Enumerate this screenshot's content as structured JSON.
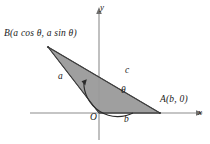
{
  "figure": {
    "type": "geometry-diagram",
    "background_color": "#ffffff",
    "axes": {
      "x_label": "x",
      "y_label": "y",
      "axis_color": "#8c8c8c",
      "origin_label": "O"
    },
    "triangle": {
      "fill_color": "#9a9a9a",
      "edge_color": "#4d4d4d",
      "vertices": [
        {
          "name": "O",
          "label": "O",
          "x": 99,
          "y": 113
        },
        {
          "name": "A",
          "label": "A(b, 0)",
          "x": 160,
          "y": 113
        },
        {
          "name": "B",
          "label": "B(a cos θ, a sin θ)",
          "x": 48,
          "y": 47
        }
      ],
      "sides": [
        {
          "name": "side-a",
          "label": "a",
          "from": "O",
          "to": "B"
        },
        {
          "name": "side-b",
          "label": "b",
          "from": "O",
          "to": "A"
        },
        {
          "name": "side-c",
          "label": "c",
          "from": "B",
          "to": "A"
        }
      ]
    },
    "angle": {
      "label": "θ",
      "vertex": "O",
      "from_ray": "positive x-axis",
      "to_ray": "side a toward B",
      "direction": "counterclockwise",
      "arc_color": "#2b2b2b"
    }
  }
}
